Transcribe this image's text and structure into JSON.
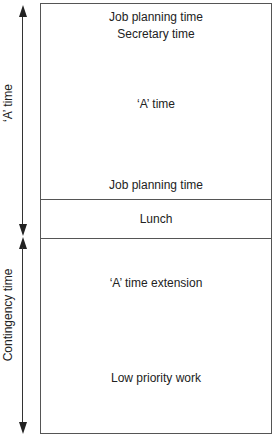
{
  "diagram": {
    "axes": {
      "a_time_label": "‘A’ time",
      "contingency_label": "Contingency time"
    },
    "sections": {
      "top": {
        "line1": "Job planning time",
        "line2": "Secretary time",
        "middle": "‘A’ time",
        "bottom": "Job planning time"
      },
      "lunch": "Lunch",
      "lower": {
        "extension": "‘A’ time extension",
        "low_priority": "Low priority work"
      }
    }
  }
}
